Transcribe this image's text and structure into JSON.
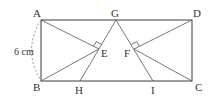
{
  "diagram": {
    "type": "geometry",
    "shape": "rectangle ABCD",
    "points": {
      "A": {
        "label": "A",
        "x": 41,
        "y": 20
      },
      "B": {
        "label": "B",
        "x": 41,
        "y": 81
      },
      "C": {
        "label": "C",
        "x": 192,
        "y": 81
      },
      "D": {
        "label": "D",
        "x": 192,
        "y": 20
      },
      "G": {
        "label": "G",
        "x": 116,
        "y": 20
      },
      "H": {
        "label": "H",
        "x": 80,
        "y": 81
      },
      "I": {
        "label": "I",
        "x": 153,
        "y": 81
      },
      "E": {
        "label": "E",
        "x": 99,
        "y": 49
      },
      "F": {
        "label": "F",
        "x": 134,
        "y": 49
      }
    },
    "segments": [
      "AB",
      "BC",
      "CD",
      "DA",
      "AE",
      "BE",
      "GH",
      "GI",
      "DF",
      "CF"
    ],
    "right_angles": [
      "E",
      "F"
    ],
    "dimension": {
      "side": "AB",
      "label": "6 cm",
      "style": "dashed arc"
    }
  }
}
